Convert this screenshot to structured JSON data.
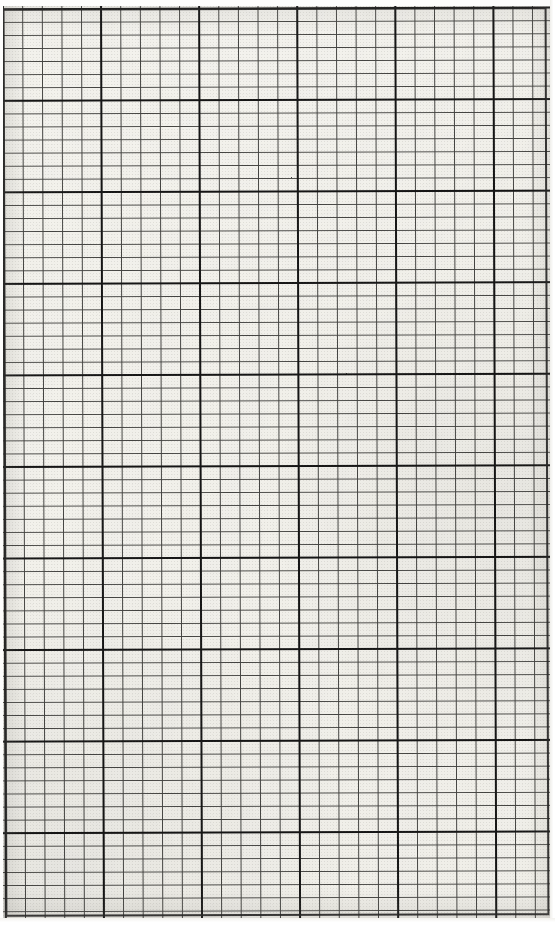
{
  "document": {
    "kind": "graph-paper-scan",
    "title": "Blank Graph Paper Sheet",
    "description": "Scanned blank sheet of squared graph paper with fine minor gridlines and heavier major gridlines every 5 squares.",
    "visible_text": "",
    "page_number": "",
    "annotations": []
  },
  "paper": {
    "background_color": "#f4f3ef",
    "page_background_color": "#fdfdfc",
    "width_px": 547,
    "height_px": 912,
    "offset_left_px": 3,
    "offset_top_px": 6,
    "rotation_degrees": "-0.18"
  },
  "grid": {
    "minor": {
      "label": "minor gridline",
      "color": "#3a3a38",
      "thickness_px": 1.1,
      "cell_width_px": 19.62,
      "cell_height_px": 13.08,
      "columns": 28,
      "rows": 70
    },
    "major": {
      "label": "major gridline",
      "color": "#151515",
      "thickness_px": 2.4,
      "every_n_cells": 5,
      "spacing_x_px": 98.1,
      "spacing_y_px": 91.56,
      "vertical_positions_px": [
        4,
        95,
        190,
        285,
        380,
        475
      ],
      "horizontal_positions_px": [
        8,
        93,
        185,
        276,
        368,
        459,
        551,
        642,
        733,
        825,
        916
      ]
    },
    "border": {
      "label": "grid border",
      "color": "#1c1c1c",
      "thickness_px": 2.2
    }
  },
  "chart_data": {
    "type": "table",
    "xlabel": "",
    "ylabel": "",
    "categories": [],
    "values": [],
    "series": [],
    "grid": true,
    "legend_position": "none",
    "note": "No plotted data — the sheet is empty squared graph paper."
  }
}
